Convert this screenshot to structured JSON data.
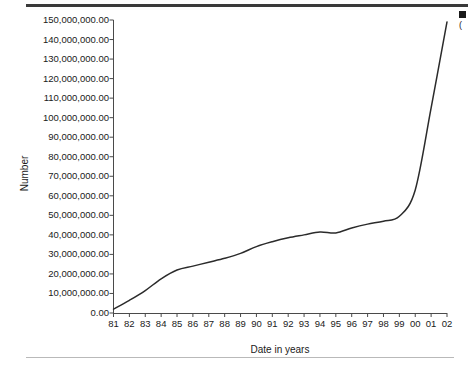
{
  "chart_data": {
    "type": "line",
    "title": "",
    "xlabel": "Date in years",
    "ylabel": "Number",
    "grid": false,
    "legend_position": "top-right-clipped",
    "legend": [
      "("
    ],
    "xlim": [
      1981,
      2002
    ],
    "ylim": [
      0,
      150000000
    ],
    "ytick_step": 10000000,
    "categories": [
      "81",
      "82",
      "83",
      "84",
      "85",
      "86",
      "87",
      "88",
      "89",
      "90",
      "91",
      "92",
      "93",
      "94",
      "95",
      "96",
      "97",
      "98",
      "99",
      "00",
      "01",
      "02"
    ],
    "x": [
      1981,
      1982,
      1983,
      1984,
      1985,
      1986,
      1987,
      1988,
      1989,
      1990,
      1991,
      1992,
      1993,
      1994,
      1995,
      1996,
      1997,
      1998,
      1999,
      2000,
      2001,
      2002
    ],
    "series": [
      {
        "name": "Number",
        "values": [
          2000000,
          6500000,
          11500000,
          17500000,
          22000000,
          24000000,
          26000000,
          28000000,
          30500000,
          34000000,
          36500000,
          38500000,
          40000000,
          41500000,
          41000000,
          43500000,
          45500000,
          47000000,
          49500000,
          63000000,
          105000000,
          149000000
        ]
      }
    ],
    "ytick_labels": [
      "0.00",
      "10,000,000.00",
      "20,000,000.00",
      "30,000,000.00",
      "40,000,000.00",
      "50,000,000.00",
      "60,000,000.00",
      "70,000,000.00",
      "80,000,000.00",
      "90,000,000.00",
      "100,000,000.00",
      "110,000,000.00",
      "120,000,000.00",
      "130,000,000.00",
      "140,000,000.00",
      "150,000,000.00"
    ],
    "line_color": "#2b2b2b"
  }
}
